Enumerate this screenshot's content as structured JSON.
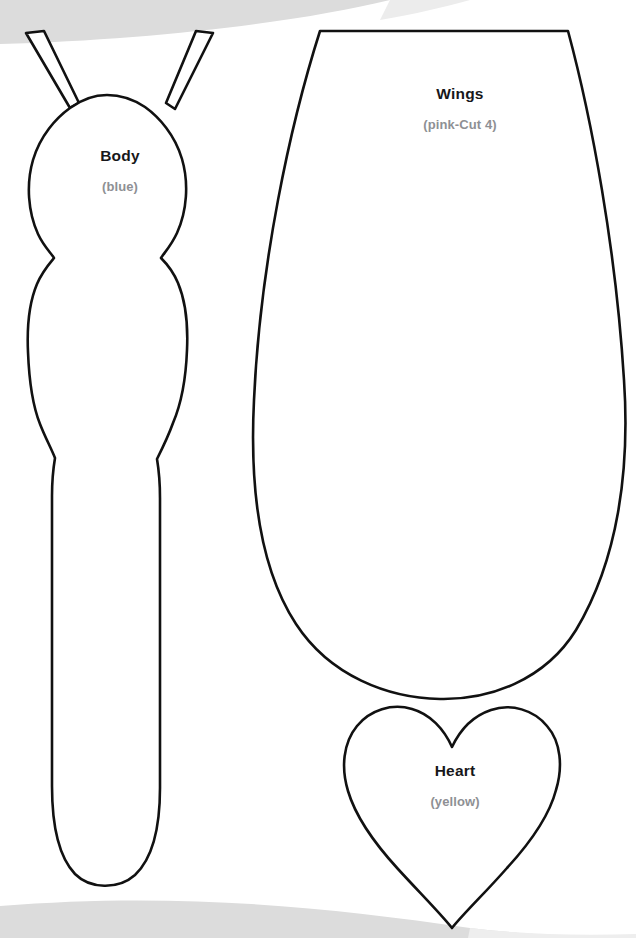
{
  "document": {
    "kind": "craft-sewing-template",
    "background_color": "#ffffff",
    "outline_color": "#111111",
    "title_color": "#17171a",
    "note_color": "#8e9094",
    "scan_shadow_color": "#dcdcdc"
  },
  "pieces": [
    {
      "id": "body",
      "title": "Body",
      "note": "(blue)",
      "shape": "bug-body-with-antennae"
    },
    {
      "id": "wings",
      "title": "Wings",
      "note": "(pink-Cut 4)",
      "shape": "rounded-wing-petal"
    },
    {
      "id": "heart",
      "title": "Heart",
      "note": "(yellow)",
      "shape": "heart"
    }
  ],
  "decorations": {
    "top_scan_edge": "curved-gray-band",
    "bottom_scan_edge": "curved-gray-band"
  }
}
